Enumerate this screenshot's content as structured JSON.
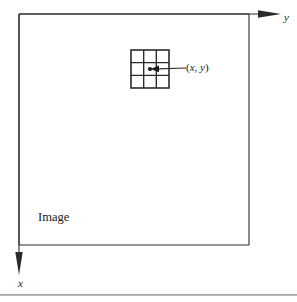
{
  "figure": {
    "title_caption": "",
    "background_color": "#ffffff",
    "stroke_color": "#2b2b2b",
    "rule_color": "#9a9a9a"
  },
  "axes": {
    "origin": {
      "x": 19,
      "y": 14
    },
    "y_axis": {
      "label": "y",
      "direction": "right",
      "arrow_tip_x": 281,
      "arrow_tip_y": 14
    },
    "x_axis": {
      "label": "x",
      "direction": "down",
      "arrow_tip_x": 19,
      "arrow_tip_y": 275
    }
  },
  "image_region": {
    "label": "Image",
    "left": 19,
    "top": 14,
    "right": 249,
    "bottom": 245
  },
  "neighborhood_grid": {
    "rows": 3,
    "cols": 3,
    "left": 131,
    "top": 50,
    "size": 38,
    "center_dot_label": "center-pixel"
  },
  "callout": {
    "label": "(x, y)",
    "label_open_paren": "(",
    "label_x": "x",
    "label_comma": ", ",
    "label_y": "y",
    "label_close_paren": ")",
    "arrow_from_x": 186,
    "arrow_from_y": 68,
    "arrow_to_x": 152,
    "arrow_to_y": 69
  }
}
